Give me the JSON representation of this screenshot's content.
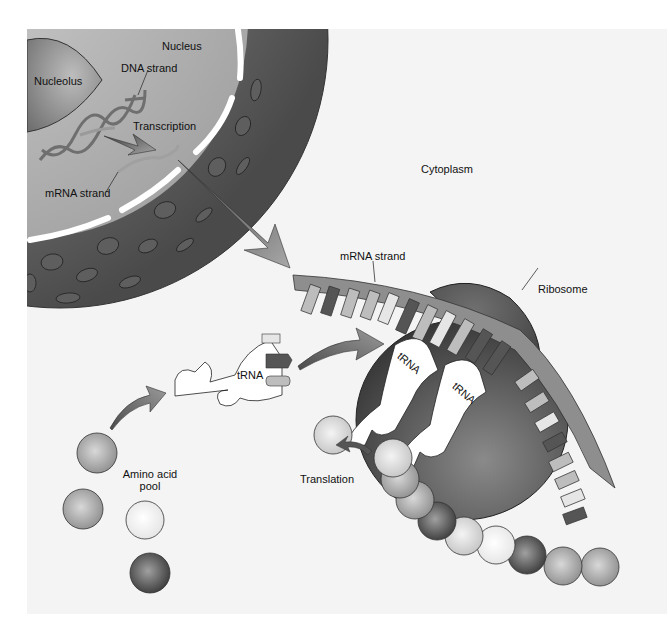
{
  "diagram": {
    "labels": {
      "nucleus": "Nucleus",
      "nucleolus": "Nucleolus",
      "dna_strand": "DNA strand",
      "transcription": "Transcription",
      "mrna_strand_nucleus": "mRNA strand",
      "cytoplasm": "Cytoplasm",
      "mrna_strand_cytoplasm": "mRNA strand",
      "ribosome": "Ribosome",
      "trna_free": "tRNA",
      "trna_ribosome_1": "tRNA",
      "trna_ribosome_2": "tRNA",
      "amino_acid_pool_line1": "Amino acid",
      "amino_acid_pool_line2": "pool",
      "translation": "Translation"
    },
    "colors": {
      "background": "#ffffff",
      "cytoplasm_tint": "#f2f2f2",
      "nucleus_inner": "#b8b8b8",
      "nucleus_outer": "#6e6e6e",
      "ribosome": "#555555",
      "strand": "#8c8c8c",
      "arrow": "#5a5a5a"
    }
  }
}
